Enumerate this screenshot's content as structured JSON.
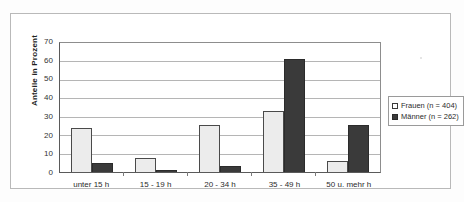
{
  "chart_data": {
    "type": "bar",
    "title": "",
    "xlabel": "",
    "ylabel": "Anteile in Prozent",
    "ylim": [
      0,
      70
    ],
    "ytick_step": 10,
    "yticks": [
      70,
      60,
      50,
      40,
      30,
      20,
      10,
      0
    ],
    "grid": true,
    "legend_position": "right",
    "categories": [
      "unter 15 h",
      "15 - 19 h",
      "20 - 34 h",
      "35 - 49 h",
      "50 u. mehr h"
    ],
    "series": [
      {
        "name": "Frauen (n = 404)",
        "color": "#ececec",
        "values": [
          24,
          7.5,
          25.5,
          33,
          6
        ]
      },
      {
        "name": "Männer (n = 262)",
        "color": "#3a3a3a",
        "values": [
          5,
          1,
          3.5,
          61.5,
          25.5
        ]
      }
    ]
  },
  "legend": {
    "items": [
      {
        "label": "Frauen (n = 404)"
      },
      {
        "label": "Männer (n = 262)"
      }
    ]
  },
  "colors": {
    "frauen": "#ececec",
    "maenner": "#3a3a3a",
    "axis": "#5a5a5a",
    "grid": "#b5b5b5",
    "frame": "#b9b9b9"
  }
}
